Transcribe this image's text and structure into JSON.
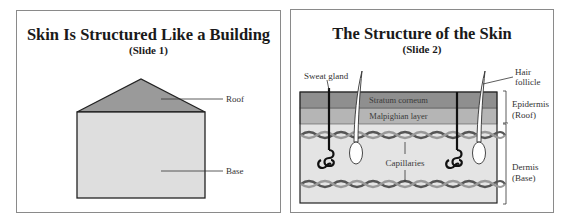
{
  "slides": [
    {
      "title": "Skin Is Structured Like a Building",
      "subtitle": "(Slide 1)",
      "labels": {
        "roof": "Roof",
        "base": "Base"
      },
      "colors": {
        "roof": "#9a9a9a",
        "base": "#dedede",
        "outline": "#222222"
      }
    },
    {
      "title": "The Structure of the Skin",
      "subtitle": "(Slide 2)",
      "labels": {
        "sweat_gland": "Sweat gland",
        "hair_follicle_line1": "Hair",
        "hair_follicle_line2": "follicle",
        "stratum_corneum": "Stratum corneum",
        "malpighian_layer": "Malpighian layer",
        "capillaries": "Capillaries",
        "epidermis_line1": "Epidermis",
        "epidermis_line2": "(Roof)",
        "dermis_line1": "Dermis",
        "dermis_line2": "(Base)"
      },
      "colors": {
        "stratum_corneum": "#8f8f8f",
        "malpighian_layer": "#b5b5b5",
        "dermis": "#e4e4e4",
        "capillary": "#6a6a6a"
      }
    }
  ]
}
